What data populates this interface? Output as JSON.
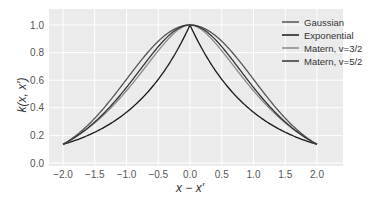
{
  "chart_data": {
    "type": "line",
    "title": "",
    "xlabel": "x − x′",
    "ylabel": "k(x, x′)",
    "xlim": [
      -2.2,
      2.2
    ],
    "ylim": [
      0.0,
      1.08
    ],
    "grid": true,
    "legend_position": "upper right",
    "xticks": [
      "−2.0",
      "−1.5",
      "−1.0",
      "−0.5",
      "0.0",
      "0.5",
      "1.0",
      "1.5",
      "2.0"
    ],
    "xtick_values": [
      -2.0,
      -1.5,
      -1.0,
      -0.5,
      0.0,
      0.5,
      1.0,
      1.5,
      2.0
    ],
    "yticks": [
      "0.0",
      "0.2",
      "0.4",
      "0.6",
      "0.8",
      "1.0"
    ],
    "ytick_values": [
      0.0,
      0.2,
      0.4,
      0.6,
      0.8,
      1.0
    ],
    "x": [
      -2.0,
      -1.75,
      -1.5,
      -1.25,
      -1.0,
      -0.75,
      -0.5,
      -0.25,
      0.0,
      0.25,
      0.5,
      0.75,
      1.0,
      1.25,
      1.5,
      1.75,
      2.0
    ],
    "series": [
      {
        "name": "Gaussian",
        "color": "#555555",
        "values": [
          0.135,
          0.216,
          0.325,
          0.458,
          0.607,
          0.755,
          0.882,
          0.969,
          1.0,
          0.969,
          0.882,
          0.755,
          0.607,
          0.458,
          0.325,
          0.216,
          0.135
        ]
      },
      {
        "name": "Exponential",
        "color": "#1a1a1a",
        "values": [
          0.135,
          0.174,
          0.223,
          0.287,
          0.368,
          0.472,
          0.607,
          0.779,
          1.0,
          0.779,
          0.607,
          0.472,
          0.368,
          0.287,
          0.223,
          0.174,
          0.135
        ]
      },
      {
        "name": "Matern, v=3/2",
        "color": "#8a8a8a",
        "values": [
          0.135,
          0.194,
          0.272,
          0.372,
          0.49,
          0.624,
          0.764,
          0.896,
          1.0,
          0.896,
          0.764,
          0.624,
          0.49,
          0.372,
          0.272,
          0.194,
          0.135
        ]
      },
      {
        "name": "Matern, v=5/2",
        "color": "#333333",
        "values": [
          0.135,
          0.205,
          0.298,
          0.414,
          0.549,
          0.692,
          0.829,
          0.942,
          1.0,
          0.942,
          0.829,
          0.692,
          0.549,
          0.414,
          0.298,
          0.205,
          0.135
        ]
      }
    ]
  }
}
